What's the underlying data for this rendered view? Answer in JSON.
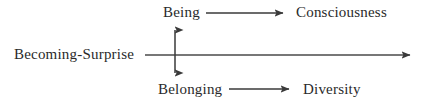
{
  "diagram": {
    "type": "concept-axis-diagram",
    "background_color": "#ffffff",
    "stroke_color": "#3a3a3a",
    "text_color": "#2a2a2a",
    "nodes": {
      "origin_label": "Becoming-Surprise",
      "upper_source": "Being",
      "upper_target": "Consciousness",
      "lower_source": "Belonging",
      "lower_target": "Diversity"
    },
    "arrows": [
      {
        "name": "horizontal-axis-arrow",
        "from": "Becoming-Surprise",
        "to": "",
        "direction": "right",
        "heads": "single",
        "x1": 145,
        "y1": 55,
        "x2": 415,
        "y2": 55
      },
      {
        "name": "vertical-double-arrow",
        "from": "Belonging",
        "to": "Being",
        "direction": "vertical",
        "heads": "double",
        "x1": 175,
        "y1": 24,
        "x2": 175,
        "y2": 79
      },
      {
        "name": "being-to-consciousness-arrow",
        "from": "Being",
        "to": "Consciousness",
        "direction": "right",
        "heads": "single",
        "x1": 206,
        "y1": 13,
        "x2": 287,
        "y2": 13
      },
      {
        "name": "belonging-to-diversity-arrow",
        "from": "Belonging",
        "to": "Diversity",
        "direction": "right",
        "heads": "single",
        "x1": 229,
        "y1": 89,
        "x2": 293,
        "y2": 89
      }
    ]
  }
}
